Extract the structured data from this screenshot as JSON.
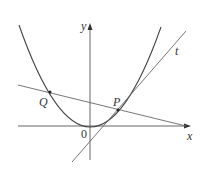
{
  "figure": {
    "type": "parabola-tangent-secant diagram",
    "colors": {
      "background": "#ffffff",
      "axes": "#555555",
      "curve": "#444444",
      "lines": "#666666",
      "points": "#222222",
      "text": "#333333"
    },
    "axes": {
      "x_label": "x",
      "y_label": "y",
      "origin_label": "0"
    },
    "points": [
      {
        "name": "Q",
        "label": "Q"
      },
      {
        "name": "P",
        "label": "P"
      }
    ],
    "lines": [
      {
        "name": "tangent",
        "label": "t"
      },
      {
        "name": "secant-QP",
        "label": ""
      }
    ],
    "curve": {
      "name": "parabola",
      "label": ""
    }
  }
}
